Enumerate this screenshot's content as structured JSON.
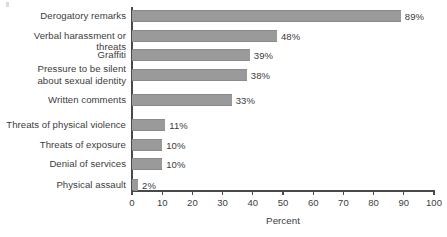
{
  "chart_data": {
    "type": "bar",
    "orientation": "horizontal",
    "title": "",
    "xlabel": "Percent",
    "ylabel": "",
    "xlim": [
      0,
      100
    ],
    "xticks": [
      0,
      10,
      20,
      30,
      40,
      50,
      60,
      70,
      80,
      90,
      100
    ],
    "xtick_labels": [
      "0",
      "10",
      "20",
      "30",
      "40",
      "50",
      "60",
      "70",
      "80",
      "90",
      "100"
    ],
    "grid": false,
    "legend": null,
    "bar_color": "#9a9a9a",
    "text_color": "#3d3d3d",
    "axis_color": "#4a4a4a",
    "value_suffix": "%",
    "categories": [
      "Derogatory remarks",
      "Verbal harassment or threats",
      "Graffiti",
      "Pressure to be silent\nabout sexual identity",
      "Written comments",
      "Threats of physical violence",
      "Threats of exposure",
      "Denial of services",
      "Physical assault"
    ],
    "values": [
      89,
      48,
      39,
      38,
      33,
      11,
      10,
      10,
      2
    ],
    "value_labels": [
      "89%",
      "48%",
      "39%",
      "38%",
      "33%",
      "11%",
      "10%",
      "10%",
      "2%"
    ]
  }
}
